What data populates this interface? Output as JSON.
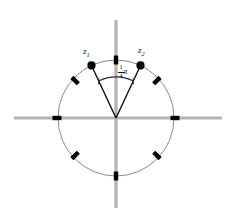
{
  "figure": {
    "type": "complex-plane-unit-circle",
    "title": "",
    "canvas": {
      "width": 231,
      "height": 224,
      "background": "#ffffff"
    },
    "colors": {
      "axis": "#b0b0b0",
      "circle": "#555555",
      "point": "#000000",
      "radius_line": "#000000",
      "tick": "#000000",
      "arc": "#333333",
      "text": "#1a1a1a"
    },
    "geometry": {
      "center_x": 116,
      "center_y": 118,
      "radius": 58,
      "axis_extent_x": [
        14,
        222
      ],
      "axis_extent_y": [
        20,
        208
      ]
    },
    "points": [
      {
        "id": "z1",
        "label": "z",
        "subscript": "1",
        "angle_deg": 115,
        "label_x": 83,
        "label_y": 48
      },
      {
        "id": "z2",
        "label": "z",
        "subscript": "2",
        "angle_deg": 65,
        "label_x": 138,
        "label_y": 47
      }
    ],
    "ticks_deg": [
      0,
      45,
      90,
      135,
      180,
      225,
      270,
      315
    ],
    "angle_annotation": {
      "numerator": "1",
      "denominator": "4",
      "symbol": "π",
      "text": "1/4 π",
      "arc_start_deg": 65,
      "arc_end_deg": 115,
      "arc_radius": 41
    }
  }
}
